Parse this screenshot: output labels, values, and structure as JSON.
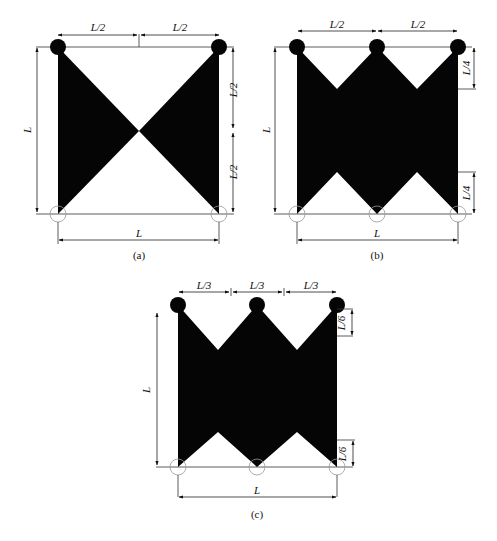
{
  "figure": {
    "panels": [
      {
        "id": "a",
        "caption": "(a)",
        "top_labels": [
          "L/2",
          "L/2"
        ],
        "right_labels": [
          "L/2",
          "L/2"
        ],
        "left_label": "L",
        "bottom_label": "L",
        "description": "Bow-tie shaped domain: two triangles meeting at center, pinned supports at top corners, roller supports at bottom corners"
      },
      {
        "id": "b",
        "caption": "(b)",
        "top_labels": [
          "L/2",
          "L/2"
        ],
        "right_labels": [
          "L/4",
          "L/4"
        ],
        "left_label": "L",
        "bottom_label": "L",
        "description": "Double-zigzag domain with 3 top pinned supports and 3 bottom roller supports, notch depth L/4"
      },
      {
        "id": "c",
        "caption": "(c)",
        "top_labels": [
          "L/3",
          "L/3",
          "L/3"
        ],
        "right_labels": [
          "L/6",
          "L/6"
        ],
        "left_label": "L",
        "bottom_label": "L",
        "description": "Double-zigzag domain with 3 top pinned supports and 3 bottom roller supports, notch depth L/6"
      }
    ],
    "colors": {
      "fill": "#050505",
      "line": "#222222",
      "roller": "#999999",
      "background": "#ffffff"
    }
  }
}
